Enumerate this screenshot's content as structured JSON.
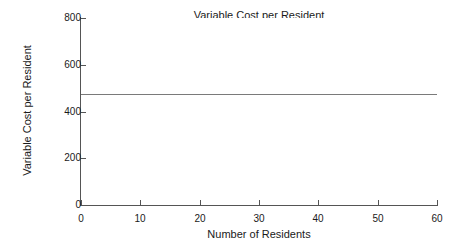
{
  "chart_data": {
    "type": "line",
    "title": "Variable Cost per Resident",
    "xlabel": "Number of Residents",
    "ylabel": "Variable Cost per Resident",
    "xlim": [
      0,
      60
    ],
    "ylim": [
      0,
      800
    ],
    "xticks": [
      0,
      10,
      20,
      30,
      40,
      50,
      60
    ],
    "yticks": [
      0,
      200,
      400,
      600,
      800
    ],
    "xtick_labels": [
      "0",
      "10",
      "20",
      "30",
      "40",
      "50",
      "60"
    ],
    "ytick_labels": [
      "0",
      "200",
      "400",
      "600",
      "800"
    ],
    "grid": false,
    "legend": null,
    "series": [
      {
        "name": "Variable Cost per Resident",
        "color": "#7a7a7a",
        "x": [
          0,
          10,
          20,
          30,
          40,
          50,
          60
        ],
        "values": [
          475,
          475,
          475,
          475,
          475,
          475,
          475
        ]
      }
    ]
  },
  "colors": {
    "axis": "#555555",
    "line": "#7a7a7a",
    "text": "#1a1a1a",
    "background": "#ffffff"
  }
}
